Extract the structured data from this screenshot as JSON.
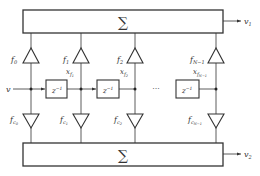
{
  "diagram": {
    "type": "dual-output FIR tapped delay line (filter bank)",
    "input_label": "v",
    "top_sum": {
      "symbol": "∑",
      "output_label": "v",
      "output_sub": "1"
    },
    "bottom_sum": {
      "symbol": "∑",
      "output_label": "v",
      "output_sub": "2"
    },
    "delay_label": "z",
    "delay_exp": "−1",
    "ellipsis": "···",
    "taps": [
      {
        "top_gain": "f",
        "top_sub": "0",
        "bottom_gain": "f",
        "bottom_sub": "c",
        "bottom_subsub": "0",
        "state": "",
        "state_sub": ""
      },
      {
        "top_gain": "f",
        "top_sub": "1",
        "bottom_gain": "f",
        "bottom_sub": "c",
        "bottom_subsub": "1",
        "state": "x",
        "state_sub": "f",
        "state_subsub": "1"
      },
      {
        "top_gain": "f",
        "top_sub": "2",
        "bottom_gain": "f",
        "bottom_sub": "c",
        "bottom_subsub": "2",
        "state": "x",
        "state_sub": "f",
        "state_subsub": "2"
      },
      {
        "top_gain": "f",
        "top_sub": "N−1",
        "bottom_gain": "f",
        "bottom_sub": "c",
        "bottom_subsub": "N−1",
        "state": "x",
        "state_sub": "f",
        "state_subsub": "N−1"
      }
    ]
  }
}
